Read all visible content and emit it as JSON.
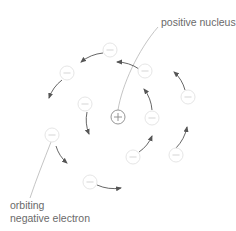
{
  "labels": {
    "nucleus": "positive nucleus",
    "electron_line1": "orbiting",
    "electron_line2": "negative electron"
  },
  "nucleus": {
    "symbol": "+",
    "cx": 118,
    "cy": 117,
    "r": 7
  },
  "electron_symbol": "−",
  "electrons": [
    {
      "cx": 110,
      "cy": 50
    },
    {
      "cx": 67,
      "cy": 73
    },
    {
      "cx": 145,
      "cy": 71
    },
    {
      "cx": 85,
      "cy": 104
    },
    {
      "cx": 188,
      "cy": 97
    },
    {
      "cx": 152,
      "cy": 118
    },
    {
      "cx": 52,
      "cy": 135
    },
    {
      "cx": 133,
      "cy": 157
    },
    {
      "cx": 176,
      "cy": 155
    },
    {
      "cx": 90,
      "cy": 182
    }
  ],
  "arrows": [
    {
      "from": [
        103,
        53
      ],
      "to": [
        81,
        62
      ]
    },
    {
      "from": [
        62,
        80
      ],
      "to": [
        49,
        98
      ]
    },
    {
      "from": [
        139,
        69
      ],
      "to": [
        117,
        62
      ]
    },
    {
      "from": [
        87,
        112
      ],
      "to": [
        89,
        134
      ]
    },
    {
      "from": [
        185,
        90
      ],
      "to": [
        174,
        72
      ]
    },
    {
      "from": [
        152,
        110
      ],
      "to": [
        144,
        89
      ]
    },
    {
      "from": [
        56,
        146
      ],
      "to": [
        67,
        163
      ]
    },
    {
      "from": [
        139,
        152
      ],
      "to": [
        152,
        136
      ]
    },
    {
      "from": [
        176,
        148
      ],
      "to": [
        187,
        127
      ]
    },
    {
      "from": [
        97,
        185
      ],
      "to": [
        121,
        188
      ]
    }
  ],
  "colors": {
    "electron_stroke": "#e6e6e6",
    "electron_symbol": "#d0d0d0",
    "nucleus_stroke": "#8a8a8a",
    "arrow": "#555555",
    "leader": "#b5b5b5",
    "text": "#6a6a6a"
  }
}
